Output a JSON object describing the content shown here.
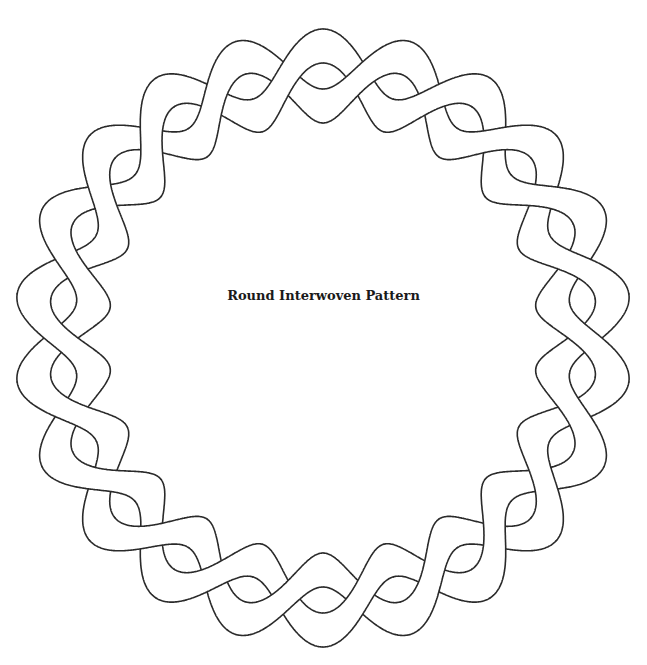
{
  "diagram": {
    "title": "Round Interwoven Pattern",
    "type": "interwoven-ring-line-art",
    "center": [
      323,
      338
    ],
    "radius_mean": 262,
    "wave_amplitude": 30,
    "band_half_width": 17,
    "crossings": 22,
    "stroke_color": "#2a2a2a",
    "fill_color": "#ffffff",
    "background": "#ffffff"
  }
}
